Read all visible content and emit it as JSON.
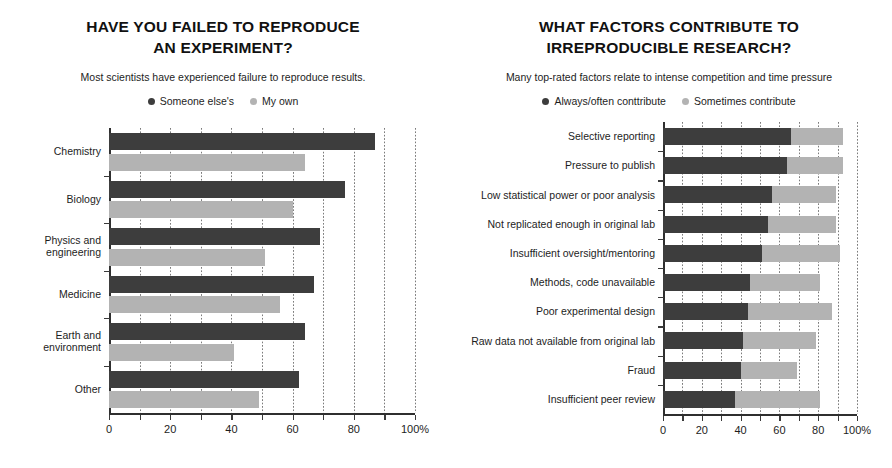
{
  "colors": {
    "dark": "#3d3d3d",
    "light": "#b3b3b3",
    "axis": "#2f2f2f",
    "grid": "#7c7c7c",
    "text": "#1d1d1d"
  },
  "left_panel": {
    "title_line1": "HAVE YOU FAILED TO REPRODUCE",
    "title_line2": "AN EXPERIMENT?",
    "subtitle": "Most scientists have experienced failure to reproduce results.",
    "legend": [
      {
        "label": "Someone else's",
        "color": "#3d3d3d",
        "marker": "legend-dot-someone-elses"
      },
      {
        "label": "My own",
        "color": "#b3b3b3",
        "marker": "legend-dot-my-own"
      }
    ]
  },
  "right_panel": {
    "title_line1": "WHAT FACTORS CONTRIBUTE TO",
    "title_line2": "IRREPRODUCIBLE RESEARCH?",
    "subtitle": "Many top-rated factors relate to intense competition and time pressure",
    "legend": [
      {
        "label": "Always/often conttribute",
        "color": "#3d3d3d",
        "marker": "legend-dot-always-often"
      },
      {
        "label": "Sometimes contribute",
        "color": "#b3b3b3",
        "marker": "legend-dot-sometimes"
      }
    ]
  },
  "chart_data": [
    {
      "id": "failed-to-reproduce",
      "type": "bar",
      "orientation": "horizontal",
      "grouping": "grouped",
      "title": "HAVE YOU FAILED TO REPRODUCE AN EXPERIMENT?",
      "subtitle": "Most scientists have experienced failure to reproduce results.",
      "xlabel": "",
      "ylabel": "",
      "xlim": [
        0,
        100
      ],
      "xticks": [
        0,
        10,
        20,
        30,
        40,
        50,
        60,
        70,
        80,
        90,
        100
      ],
      "xtick_labels": [
        "0",
        "",
        "20",
        "",
        "40",
        "",
        "60",
        "",
        "80",
        "",
        "100%"
      ],
      "grid": "vertical-dotted",
      "legend_position": "top-center",
      "categories": [
        "Chemistry",
        "Biology",
        "Physics and\nengineering",
        "Medicine",
        "Earth and\nenvironment",
        "Other"
      ],
      "series": [
        {
          "name": "Someone else's",
          "color": "#3d3d3d",
          "values": [
            87,
            77,
            69,
            67,
            64,
            62
          ]
        },
        {
          "name": "My own",
          "color": "#b3b3b3",
          "values": [
            64,
            60,
            51,
            56,
            41,
            49
          ]
        }
      ]
    },
    {
      "id": "factors-irreproducible",
      "type": "bar",
      "orientation": "horizontal",
      "grouping": "stacked",
      "title": "WHAT FACTORS CONTRIBUTE TO IRREPRODUCIBLE RESEARCH?",
      "subtitle": "Many top-rated factors relate to intense competition and time pressure",
      "xlabel": "",
      "ylabel": "",
      "xlim": [
        0,
        100
      ],
      "xticks": [
        0,
        10,
        20,
        30,
        40,
        50,
        60,
        70,
        80,
        90,
        100
      ],
      "xtick_labels": [
        "0",
        "",
        "20",
        "",
        "40",
        "",
        "60",
        "",
        "80",
        "",
        "100%"
      ],
      "grid": "vertical-dotted",
      "legend_position": "top-center",
      "categories": [
        "Selective reporting",
        "Pressure to publish",
        "Low statistical power or poor analysis",
        "Not replicated enough in original lab",
        "Insufficient oversight/mentoring",
        "Methods, code unavailable",
        "Poor experimental design",
        "Raw data not available from original lab",
        "Fraud",
        "Insufficient peer review"
      ],
      "series": [
        {
          "name": "Always/often conttribute",
          "color": "#3d3d3d",
          "values": [
            66,
            64,
            56,
            54,
            51,
            45,
            44,
            41,
            40,
            37
          ]
        },
        {
          "name": "Sometimes contribute",
          "color": "#b3b3b3",
          "values": [
            27,
            29,
            33,
            35,
            40,
            36,
            43,
            38,
            29,
            44
          ]
        }
      ]
    }
  ]
}
